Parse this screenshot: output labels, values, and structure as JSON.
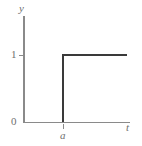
{
  "figure": {
    "background_color": "#ffffff",
    "axis_color": "#8a8a8a",
    "curve_color": "#3a3a3a",
    "label_color": "#6f6f6f",
    "axis_labels": {
      "y": "y",
      "x": "t"
    },
    "tick_labels": {
      "origin": "0",
      "y_one": "1",
      "x_a": "a"
    }
  },
  "chart_data": {
    "type": "line",
    "title": "",
    "subtitle": "",
    "xlabel": "t",
    "ylabel": "y",
    "series": [
      {
        "name": "unit step",
        "x": [
          0,
          "a",
          "a",
          "t_max"
        ],
        "y": [
          0,
          0,
          1,
          1
        ],
        "color": "#3a3a3a"
      }
    ],
    "xticks": [
      "a"
    ],
    "xticklabels": [
      "a"
    ],
    "yticks": [
      0,
      1
    ],
    "yticklabels": [
      "0",
      "1"
    ],
    "xlim": [
      0,
      "t_max"
    ],
    "ylim": [
      0,
      1.6
    ],
    "grid": false,
    "legend": false,
    "legend_position": "none",
    "annotations": [
      {
        "text": "0",
        "role": "origin-label"
      },
      {
        "text": "1",
        "role": "y-tick-label"
      },
      {
        "text": "a",
        "role": "x-tick-label"
      },
      {
        "text": "y",
        "role": "y-axis-label"
      },
      {
        "text": "t",
        "role": "x-axis-label"
      }
    ]
  }
}
